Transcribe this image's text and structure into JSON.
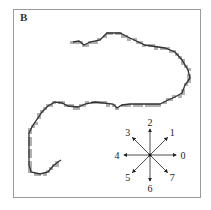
{
  "panel": {
    "label": "B"
  },
  "figure": {
    "contour_color": "#333333",
    "cell_color": "#b0b0b0"
  },
  "compass": {
    "directions": [
      {
        "code": "0",
        "angle_deg": 0
      },
      {
        "code": "1",
        "angle_deg": 45
      },
      {
        "code": "2",
        "angle_deg": 90
      },
      {
        "code": "3",
        "angle_deg": 135
      },
      {
        "code": "4",
        "angle_deg": 180
      },
      {
        "code": "5",
        "angle_deg": 225
      },
      {
        "code": "6",
        "angle_deg": 270
      },
      {
        "code": "7",
        "angle_deg": 315
      }
    ]
  }
}
